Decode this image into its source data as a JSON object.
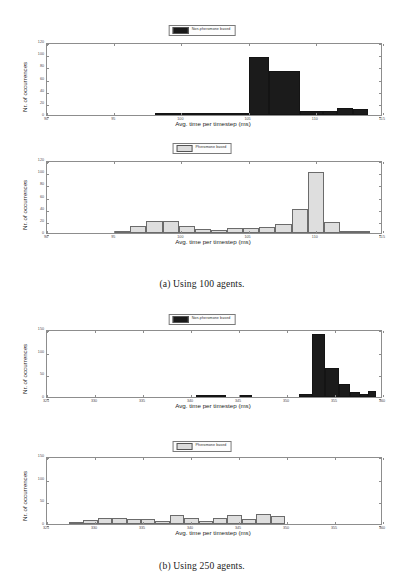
{
  "figure": {
    "subfigures": [
      {
        "caption": "(a) Using 100 agents."
      },
      {
        "caption": "(b) Using 250 agents."
      }
    ]
  },
  "axis_titles": {
    "x": "Avg. time per timestep (ms)",
    "y": "Nr. of occurrences"
  },
  "legends": {
    "non_pheromone": "Non-pheromone based",
    "pheromone": "Pheromone based"
  },
  "colors": {
    "dark_series": "#1b1b1b",
    "light_series": "#dedede",
    "axis": "#8d8d8d",
    "text": "#262626",
    "background": "#ffffff"
  },
  "chart_data": [
    {
      "id": "a-non-pheromone",
      "type": "bar",
      "title": "",
      "subfigure": "(a) Using 100 agents.",
      "series_name": "Non-pheromone based",
      "xlabel": "Avg. time per timestep (ms)",
      "ylabel": "Nr. of occurrences",
      "xlim": [
        90,
        115
      ],
      "ylim": [
        0,
        120
      ],
      "xticks": [
        90,
        95,
        100,
        105,
        110,
        115
      ],
      "yticks": [
        0,
        20,
        40,
        60,
        80,
        100,
        120
      ],
      "grid": false,
      "legend_position": "above-center",
      "bin_width": 1.0,
      "bins": [
        {
          "x0": 98.0,
          "x1": 99.0,
          "value": 1
        },
        {
          "x0": 99.0,
          "x1": 100.0,
          "value": 1
        },
        {
          "x0": 100.0,
          "x1": 101.0,
          "value": 2
        },
        {
          "x0": 101.0,
          "x1": 102.0,
          "value": 1
        },
        {
          "x0": 102.0,
          "x1": 103.0,
          "value": 1
        },
        {
          "x0": 103.0,
          "x1": 104.0,
          "value": 1
        },
        {
          "x0": 104.0,
          "x1": 105.0,
          "value": 1
        },
        {
          "x0": 105.0,
          "x1": 106.5,
          "value": 96
        },
        {
          "x0": 106.5,
          "x1": 108.8,
          "value": 73
        },
        {
          "x0": 108.8,
          "x1": 110.5,
          "value": 7
        },
        {
          "x0": 110.5,
          "x1": 111.6,
          "value": 6
        },
        {
          "x0": 111.6,
          "x1": 112.8,
          "value": 12
        },
        {
          "x0": 112.8,
          "x1": 113.9,
          "value": 10
        }
      ]
    },
    {
      "id": "a-pheromone",
      "type": "bar",
      "title": "",
      "subfigure": "(a) Using 100 agents.",
      "series_name": "Pheromone based",
      "xlabel": "Avg. time per timestep (ms)",
      "ylabel": "Nr. of occurrences",
      "xlim": [
        90,
        115
      ],
      "ylim": [
        0,
        120
      ],
      "xticks": [
        90,
        95,
        100,
        105,
        110,
        115
      ],
      "yticks": [
        0,
        20,
        40,
        60,
        80,
        100,
        120
      ],
      "grid": false,
      "legend_position": "above-center",
      "bin_width": 1.0,
      "bins": [
        {
          "x0": 95.0,
          "x1": 96.2,
          "value": 1
        },
        {
          "x0": 96.2,
          "x1": 97.4,
          "value": 12
        },
        {
          "x0": 97.4,
          "x1": 98.6,
          "value": 19
        },
        {
          "x0": 98.6,
          "x1": 99.8,
          "value": 19
        },
        {
          "x0": 99.8,
          "x1": 101.0,
          "value": 12
        },
        {
          "x0": 101.0,
          "x1": 102.2,
          "value": 6
        },
        {
          "x0": 102.2,
          "x1": 103.4,
          "value": 5
        },
        {
          "x0": 103.4,
          "x1": 104.6,
          "value": 8
        },
        {
          "x0": 104.6,
          "x1": 105.8,
          "value": 8
        },
        {
          "x0": 105.8,
          "x1": 107.0,
          "value": 10
        },
        {
          "x0": 107.0,
          "x1": 108.2,
          "value": 15
        },
        {
          "x0": 108.2,
          "x1": 109.4,
          "value": 40
        },
        {
          "x0": 109.4,
          "x1": 110.6,
          "value": 101
        },
        {
          "x0": 110.6,
          "x1": 111.8,
          "value": 18
        },
        {
          "x0": 111.8,
          "x1": 113.0,
          "value": 3
        },
        {
          "x0": 113.0,
          "x1": 114.0,
          "value": 2
        }
      ]
    },
    {
      "id": "b-non-pheromone",
      "type": "bar",
      "title": "",
      "subfigure": "(b) Using 250 agents.",
      "series_name": "Non-pheromone based",
      "xlabel": "Avg. time per timestep (ms)",
      "ylabel": "Nr. of occurrences",
      "xlim": [
        325,
        360
      ],
      "ylim": [
        0,
        150
      ],
      "xticks": [
        325,
        330,
        335,
        340,
        345,
        350,
        355,
        360
      ],
      "yticks": [
        0,
        50,
        100,
        150
      ],
      "grid": false,
      "legend_position": "above-center",
      "bin_width": 1.0,
      "bins": [
        {
          "x0": 340.5,
          "x1": 342.2,
          "value": 4
        },
        {
          "x0": 342.2,
          "x1": 343.6,
          "value": 3
        },
        {
          "x0": 345.0,
          "x1": 346.4,
          "value": 5
        },
        {
          "x0": 351.3,
          "x1": 352.6,
          "value": 7
        },
        {
          "x0": 352.6,
          "x1": 354.0,
          "value": 138
        },
        {
          "x0": 354.0,
          "x1": 355.4,
          "value": 63
        },
        {
          "x0": 355.4,
          "x1": 356.6,
          "value": 28
        },
        {
          "x0": 356.6,
          "x1": 357.6,
          "value": 12
        },
        {
          "x0": 357.6,
          "x1": 358.4,
          "value": 6
        },
        {
          "x0": 358.4,
          "x1": 359.3,
          "value": 14
        }
      ]
    },
    {
      "id": "b-pheromone",
      "type": "bar",
      "title": "",
      "subfigure": "(b) Using 250 agents.",
      "series_name": "Pheromone based",
      "xlabel": "Avg. time per timestep (ms)",
      "ylabel": "Nr. of occurrences",
      "xlim": [
        325,
        360
      ],
      "ylim": [
        0,
        150
      ],
      "xticks": [
        325,
        330,
        335,
        340,
        345,
        350,
        355,
        360
      ],
      "yticks": [
        0,
        50,
        100,
        150
      ],
      "grid": false,
      "legend_position": "above-center",
      "bin_width": 1.0,
      "bins": [
        {
          "x0": 327.3,
          "x1": 328.8,
          "value": 5
        },
        {
          "x0": 328.8,
          "x1": 330.3,
          "value": 9
        },
        {
          "x0": 330.3,
          "x1": 331.8,
          "value": 14
        },
        {
          "x0": 331.8,
          "x1": 333.3,
          "value": 14
        },
        {
          "x0": 333.3,
          "x1": 334.8,
          "value": 12
        },
        {
          "x0": 334.8,
          "x1": 336.3,
          "value": 11
        },
        {
          "x0": 336.3,
          "x1": 337.8,
          "value": 6
        },
        {
          "x0": 337.8,
          "x1": 339.3,
          "value": 19
        },
        {
          "x0": 339.3,
          "x1": 340.8,
          "value": 14
        },
        {
          "x0": 340.8,
          "x1": 342.3,
          "value": 6
        },
        {
          "x0": 342.3,
          "x1": 343.8,
          "value": 13
        },
        {
          "x0": 343.8,
          "x1": 345.3,
          "value": 19
        },
        {
          "x0": 345.3,
          "x1": 346.8,
          "value": 11
        },
        {
          "x0": 346.8,
          "x1": 348.3,
          "value": 23
        },
        {
          "x0": 348.3,
          "x1": 349.8,
          "value": 18
        }
      ]
    }
  ]
}
